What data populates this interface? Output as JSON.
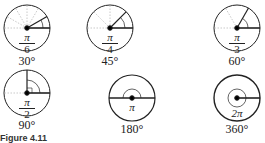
{
  "figure": {
    "caption": "Figure 4.11",
    "angles": [
      {
        "radians_num": "π",
        "radians_den": "6",
        "degrees": "30°"
      },
      {
        "radians_num": "π",
        "radians_den": "4",
        "degrees": "45°"
      },
      {
        "radians_num": "π",
        "radians_den": "3",
        "degrees": "60°"
      },
      {
        "radians_num": "π",
        "radians_den": "2",
        "degrees": "90°"
      },
      {
        "radians": "π",
        "degrees": "180°"
      },
      {
        "radians": "2π",
        "degrees": "360°"
      }
    ]
  }
}
